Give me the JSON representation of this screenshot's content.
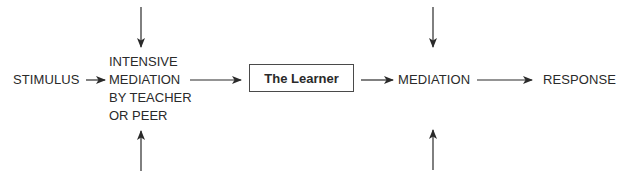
{
  "diagram": {
    "nodes": {
      "stimulus": "STIMULUS",
      "intensive_mediation": [
        "INTENSIVE",
        "MEDIATION",
        "BY TEACHER",
        "OR PEER"
      ],
      "learner": "The Learner",
      "mediation": "MEDIATION",
      "response": "RESPONSE"
    },
    "edges": [
      {
        "from": "stimulus",
        "to": "intensive_mediation"
      },
      {
        "from": "intensive_mediation",
        "to": "learner"
      },
      {
        "from": "learner",
        "to": "mediation"
      },
      {
        "from": "mediation",
        "to": "response"
      },
      {
        "from": "external-top",
        "to": "intensive_mediation"
      },
      {
        "from": "external-bottom",
        "to": "intensive_mediation"
      },
      {
        "from": "external-top",
        "to": "mediation"
      },
      {
        "from": "external-bottom",
        "to": "mediation"
      }
    ]
  }
}
